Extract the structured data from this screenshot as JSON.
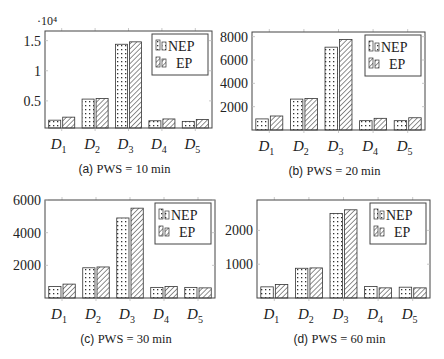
{
  "figure": {
    "legend": [
      {
        "key": "nep",
        "label": "NEP",
        "pattern": "dots"
      },
      {
        "key": "ep",
        "label": "EP",
        "pattern": "hatch"
      }
    ],
    "colors": {
      "frame": "#444444",
      "bar_stroke": "#333333",
      "pattern": "#333333",
      "grid_tick": "#bbbbbb",
      "text": "#222222"
    }
  },
  "chart_data": [
    {
      "id": "a",
      "type": "bar",
      "title": "(a) PWS = 10 min",
      "caption_tag": "(a)",
      "caption_text": "PWS = 10 min",
      "categories": [
        "D1",
        "D2",
        "D3",
        "D4",
        "D5"
      ],
      "category_labels": [
        {
          "main": "D",
          "sub": "1"
        },
        {
          "main": "D",
          "sub": "2"
        },
        {
          "main": "D",
          "sub": "3"
        },
        {
          "main": "D",
          "sub": "4"
        },
        {
          "main": "D",
          "sub": "5"
        }
      ],
      "series": [
        {
          "name": "NEP",
          "values": [
            1800,
            5300,
            14400,
            1700,
            1600
          ]
        },
        {
          "name": "EP",
          "values": [
            2300,
            5400,
            14800,
            2000,
            1900
          ]
        }
      ],
      "y_scale_label": "·10⁴",
      "yticks": [
        5000,
        10000,
        15000
      ],
      "ytick_labels": [
        "0.5",
        "1",
        "1.5"
      ],
      "ylim": [
        500,
        16600
      ],
      "xlabel": "",
      "ylabel": "",
      "grid": false,
      "legend_position": "upper right"
    },
    {
      "id": "b",
      "type": "bar",
      "title": "(b) PWS = 20 min",
      "caption_tag": "(b)",
      "caption_text": "PWS = 20 min",
      "categories": [
        "D1",
        "D2",
        "D3",
        "D4",
        "D5"
      ],
      "category_labels": [
        {
          "main": "D",
          "sub": "1"
        },
        {
          "main": "D",
          "sub": "2"
        },
        {
          "main": "D",
          "sub": "3"
        },
        {
          "main": "D",
          "sub": "4"
        },
        {
          "main": "D",
          "sub": "5"
        }
      ],
      "series": [
        {
          "name": "NEP",
          "values": [
            950,
            2650,
            7100,
            800,
            800
          ]
        },
        {
          "name": "EP",
          "values": [
            1200,
            2700,
            7750,
            1000,
            1050
          ]
        }
      ],
      "y_scale_label": "",
      "yticks": [
        2000,
        4000,
        6000,
        8000
      ],
      "ytick_labels": [
        "2000",
        "4000",
        "6000",
        "8000"
      ],
      "ylim": [
        0,
        8400
      ],
      "xlabel": "",
      "ylabel": "",
      "grid": false,
      "legend_position": "upper right"
    },
    {
      "id": "c",
      "type": "bar",
      "title": "(c) PWS = 30 min",
      "caption_tag": "(c)",
      "caption_text": "PWS = 30 min",
      "categories": [
        "D1",
        "D2",
        "D3",
        "D4",
        "D5"
      ],
      "category_labels": [
        {
          "main": "D",
          "sub": "1"
        },
        {
          "main": "D",
          "sub": "2"
        },
        {
          "main": "D",
          "sub": "3"
        },
        {
          "main": "D",
          "sub": "4"
        },
        {
          "main": "D",
          "sub": "5"
        }
      ],
      "series": [
        {
          "name": "NEP",
          "values": [
            700,
            1850,
            4900,
            650,
            650
          ]
        },
        {
          "name": "EP",
          "values": [
            850,
            1900,
            5500,
            700,
            620
          ]
        }
      ],
      "y_scale_label": "",
      "yticks": [
        2000,
        4000,
        6000
      ],
      "ytick_labels": [
        "2000",
        "4000",
        "6000"
      ],
      "ylim": [
        0,
        6000
      ],
      "xlabel": "",
      "ylabel": "",
      "grid": false,
      "legend_position": "upper right"
    },
    {
      "id": "d",
      "type": "bar",
      "title": "(d) PWS = 60 min",
      "caption_tag": "(d)",
      "caption_text": "PWS = 60 min",
      "categories": [
        "D1",
        "D2",
        "D3",
        "D4",
        "D5"
      ],
      "category_labels": [
        {
          "main": "D",
          "sub": "1"
        },
        {
          "main": "D",
          "sub": "2"
        },
        {
          "main": "D",
          "sub": "3"
        },
        {
          "main": "D",
          "sub": "4"
        },
        {
          "main": "D",
          "sub": "5"
        }
      ],
      "series": [
        {
          "name": "NEP",
          "values": [
            330,
            880,
            2500,
            340,
            320
          ]
        },
        {
          "name": "EP",
          "values": [
            400,
            890,
            2610,
            300,
            300
          ]
        }
      ],
      "y_scale_label": "",
      "yticks": [
        1000,
        2000
      ],
      "ytick_labels": [
        "1000",
        "2000"
      ],
      "ylim": [
        0,
        2900
      ],
      "xlabel": "",
      "ylabel": "",
      "grid": false,
      "legend_position": "upper right"
    }
  ],
  "layout": {
    "panels": [
      {
        "id": "a",
        "frame": {
          "x": 45,
          "y": 31,
          "w": 167,
          "h": 97
        }
      },
      {
        "id": "b",
        "frame": {
          "x": 252,
          "y": 32,
          "w": 173,
          "h": 98
        }
      },
      {
        "id": "c",
        "frame": {
          "x": 45,
          "y": 200,
          "w": 170,
          "h": 98
        }
      },
      {
        "id": "d",
        "frame": {
          "x": 257,
          "y": 200,
          "w": 173,
          "h": 98
        }
      }
    ]
  }
}
